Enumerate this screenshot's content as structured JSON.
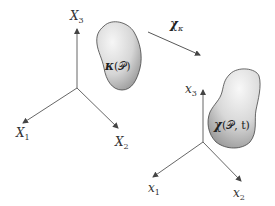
{
  "reference_frame": {
    "axes": [
      {
        "name": "X",
        "sub": "3"
      },
      {
        "name": "X",
        "sub": "1"
      },
      {
        "name": "X",
        "sub": "2"
      }
    ]
  },
  "reference_body": {
    "label_map": "κ",
    "label_arg": "(𝒫)"
  },
  "mapping_arrow": {
    "symbol": "χ",
    "sub": "κ"
  },
  "current_frame": {
    "axes": [
      {
        "name": "x",
        "sub": "3"
      },
      {
        "name": "x",
        "sub": "1"
      },
      {
        "name": "x",
        "sub": "2"
      }
    ]
  },
  "current_body": {
    "label_map": "χ",
    "label_arg": "(𝒫, t)"
  },
  "colors": {
    "axis": "#555555",
    "blob_outline": "#444444",
    "blob_light": "#f4f4f4",
    "blob_dark": "#9a9a9a"
  }
}
